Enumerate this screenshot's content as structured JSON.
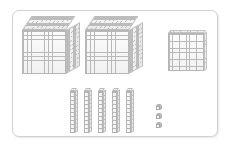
{
  "scene": {
    "title": "Base-Ten Blocks Place Value Model",
    "frame": {
      "label": "white-rounded-panel"
    },
    "background_color": "#ffffff",
    "line_color": "#b9b9b9",
    "fill_color": "#f4f4f4"
  },
  "blocks": {
    "thousands": {
      "name": "thousand-cube",
      "count": 2,
      "unit_value": 1000,
      "total": 2000,
      "items": [
        {
          "label": "thousand-cube-1",
          "x": 22,
          "y": 16,
          "w": 44,
          "h": 44,
          "d": 14
        },
        {
          "label": "thousand-cube-2",
          "x": 85,
          "y": 16,
          "w": 44,
          "h": 44,
          "d": 14
        }
      ]
    },
    "hundreds": {
      "name": "hundred-flat",
      "count": 1,
      "unit_value": 100,
      "total": 100,
      "items": [
        {
          "label": "hundred-flat-1",
          "x": 168,
          "y": 30,
          "w": 36,
          "h": 38,
          "d": 3
        }
      ]
    },
    "tens": {
      "name": "ten-rod",
      "count": 5,
      "unit_value": 10,
      "total": 50,
      "items": [
        {
          "label": "ten-rod-1",
          "x": 70,
          "y": 88,
          "w": 5,
          "h": 42,
          "d": 3
        },
        {
          "label": "ten-rod-2",
          "x": 84,
          "y": 88,
          "w": 5,
          "h": 42,
          "d": 3
        },
        {
          "label": "ten-rod-3",
          "x": 98,
          "y": 88,
          "w": 5,
          "h": 42,
          "d": 3
        },
        {
          "label": "ten-rod-4",
          "x": 112,
          "y": 88,
          "w": 5,
          "h": 42,
          "d": 3
        },
        {
          "label": "ten-rod-5",
          "x": 126,
          "y": 88,
          "w": 5,
          "h": 42,
          "d": 3
        }
      ]
    },
    "ones": {
      "name": "unit-cube",
      "count": 3,
      "unit_value": 1,
      "total": 3,
      "items": [
        {
          "label": "unit-cube-1",
          "x": 156,
          "y": 104,
          "s": 4,
          "d": 2
        },
        {
          "label": "unit-cube-2",
          "x": 156,
          "y": 113,
          "s": 4,
          "d": 2
        },
        {
          "label": "unit-cube-3",
          "x": 156,
          "y": 122,
          "s": 4,
          "d": 2
        }
      ]
    }
  },
  "value": {
    "thousands_digit": 2,
    "hundreds_digit": 1,
    "tens_digit": 5,
    "ones_digit": 3,
    "total": 2153,
    "expanded": "2000 + 100 + 50 + 3"
  }
}
